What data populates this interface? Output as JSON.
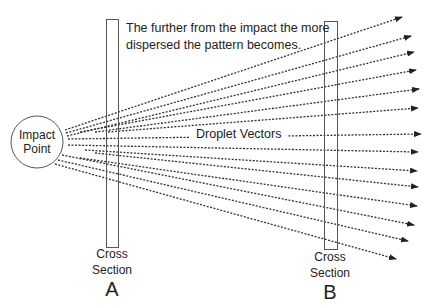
{
  "diagram": {
    "note": [
      "The further from the impact the more",
      "dispersed the pattern becomes."
    ],
    "center_label": "Droplet Vectors",
    "impact_point": {
      "line1": "Impact",
      "line2": "Point",
      "cx": 37,
      "cy": 142,
      "r": 26
    },
    "cross_sections": [
      {
        "line1": "Cross",
        "line2": "Section",
        "letter": "A",
        "x": 106,
        "y": 19,
        "w": 12,
        "h": 228
      },
      {
        "line1": "Cross",
        "line2": "Section",
        "letter": "B",
        "x": 324,
        "y": 21,
        "w": 13,
        "h": 228
      }
    ],
    "vectors": [
      {
        "x1": 65,
        "y1": 130,
        "x2": 402,
        "y2": 17
      },
      {
        "x1": 66,
        "y1": 133,
        "x2": 411,
        "y2": 36
      },
      {
        "x1": 67,
        "y1": 136,
        "x2": 414,
        "y2": 52
      },
      {
        "x1": 80,
        "y1": 132,
        "x2": 416,
        "y2": 70
      },
      {
        "x1": 95,
        "y1": 132,
        "x2": 419,
        "y2": 89
      },
      {
        "x1": 108,
        "y1": 132,
        "x2": 418,
        "y2": 108
      },
      {
        "x1": 68,
        "y1": 139,
        "x2": 421,
        "y2": 134
      },
      {
        "x1": 68,
        "y1": 145,
        "x2": 418,
        "y2": 152
      },
      {
        "x1": 85,
        "y1": 150,
        "x2": 417,
        "y2": 171
      },
      {
        "x1": 95,
        "y1": 153,
        "x2": 418,
        "y2": 187
      },
      {
        "x1": 80,
        "y1": 158,
        "x2": 417,
        "y2": 206
      },
      {
        "x1": 62,
        "y1": 155,
        "x2": 414,
        "y2": 225
      },
      {
        "x1": 58,
        "y1": 160,
        "x2": 408,
        "y2": 241
      },
      {
        "x1": 55,
        "y1": 164,
        "x2": 396,
        "y2": 259
      }
    ],
    "colors": {
      "line": "#333333",
      "outline": "#555555",
      "text": "#222222"
    }
  }
}
